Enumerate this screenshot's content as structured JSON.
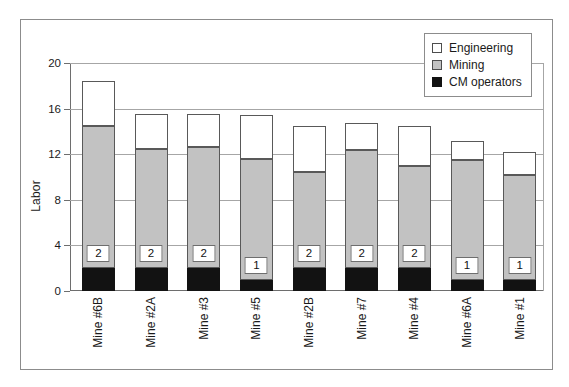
{
  "chart_data": {
    "type": "bar",
    "title": "",
    "subtitle": "",
    "xlabel": "",
    "ylabel": "Labor",
    "ylim": [
      0,
      20
    ],
    "yticks": [
      0,
      4,
      8,
      12,
      16,
      20
    ],
    "grid": true,
    "stacked": true,
    "legend_position": "top-right",
    "categories": [
      "Mine #6B",
      "Mine #2A",
      "Mine #3",
      "Mine #5",
      "Mine #2B",
      "Mine #7",
      "Mine #4",
      "Mine #6A",
      "Mine #1"
    ],
    "series": [
      {
        "name": "CM operators",
        "color": "#121212",
        "values": [
          2.0,
          2.0,
          2.0,
          1.0,
          2.0,
          2.0,
          2.0,
          1.0,
          1.0
        ]
      },
      {
        "name": "Mining",
        "color": "#c2c2c2",
        "values": [
          12.5,
          10.5,
          10.6,
          10.6,
          8.4,
          10.4,
          9.0,
          10.5,
          9.2
        ]
      },
      {
        "name": "Engineering",
        "color": "#ffffff",
        "values": [
          3.9,
          3.0,
          2.9,
          3.8,
          4.1,
          2.3,
          3.5,
          1.7,
          2.0
        ]
      }
    ],
    "stack_tops": {
      "cm_operators": [
        2.0,
        2.0,
        2.0,
        1.0,
        2.0,
        2.0,
        2.0,
        1.0,
        1.0
      ],
      "mining": [
        14.5,
        12.5,
        12.6,
        11.6,
        10.4,
        12.4,
        11.0,
        11.5,
        10.2
      ],
      "total": [
        18.4,
        15.5,
        15.5,
        15.4,
        14.5,
        14.7,
        14.5,
        13.2,
        12.2
      ]
    },
    "data_labels": [
      "2",
      "2",
      "2",
      "1",
      "2",
      "2",
      "2",
      "1",
      "1"
    ]
  },
  "axes": {
    "y_title": "Labor",
    "y_tick_labels": [
      "0",
      "4",
      "8",
      "12",
      "16",
      "20"
    ]
  },
  "legend": {
    "items": [
      {
        "label": "Engineering",
        "swatch": "white-square-icon"
      },
      {
        "label": "Mining",
        "swatch": "gray-square-icon"
      },
      {
        "label": "CM operators",
        "swatch": "black-square-icon"
      }
    ]
  }
}
